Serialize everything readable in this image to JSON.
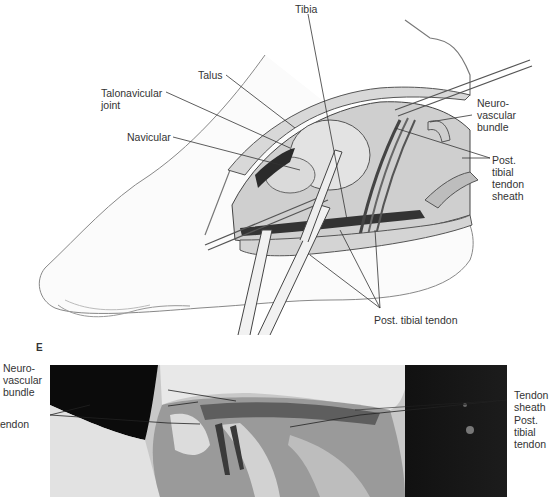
{
  "figure": {
    "illustration": {
      "labels": {
        "tibia": "Tibia",
        "talus": "Talus",
        "talonavicular_joint": "Talonavicular\njoint",
        "navicular": "Navicular",
        "neurovascular_bundle": "Neuro-\nvascular\nbundle",
        "post_tibial_tendon_sheath": "Post.\ntibial\ntendon\nsheath",
        "post_tibial_tendon": "Post. tibial tendon"
      }
    },
    "panel_letter": "E",
    "photo": {
      "labels": {
        "neurovascular_bundle": "Neuro-\nvascular\nbundle",
        "tendon": "tendon",
        "tendon_sheath": "Tendon\nsheath",
        "post_tibial_tendon": "Post.\ntibial\ntendon"
      }
    }
  }
}
